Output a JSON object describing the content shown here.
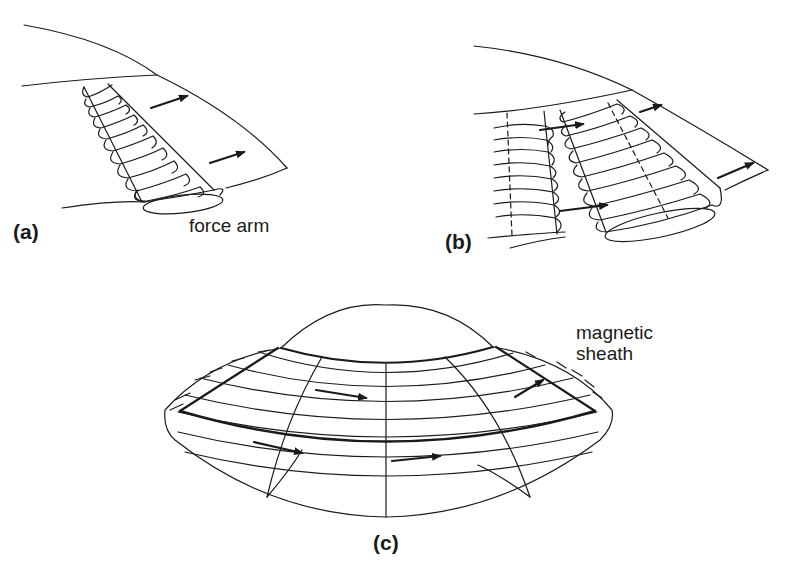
{
  "figure": {
    "panels": [
      {
        "id": "a",
        "label": "(a)",
        "annotation": "force arm"
      },
      {
        "id": "b",
        "label": "(b)"
      },
      {
        "id": "c",
        "label": "(c)",
        "annotation_lines": [
          "magnetic",
          "sheath"
        ]
      }
    ],
    "colors": {
      "line": "#1a1a1a",
      "background": "#ffffff"
    }
  }
}
